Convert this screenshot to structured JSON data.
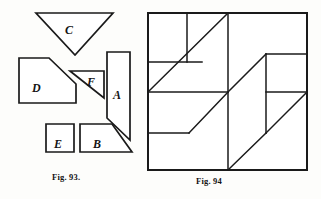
{
  "page": {
    "width": 321,
    "height": 199,
    "background_color": "#fdfdfb",
    "ink_color": "#1a1a1a"
  },
  "figures": [
    {
      "id": "fig-93",
      "caption": "Fig. 93.",
      "caption_x": 52,
      "caption_y": 172,
      "role": "dissection-pieces",
      "piece_count": 6,
      "pieces": [
        {
          "label": "C",
          "shape": "triangle",
          "orientation": "point-down",
          "label_x": 65,
          "label_y": 24,
          "points": "36,13 113,13 75,55"
        },
        {
          "label": "D",
          "shape": "pentagon",
          "label_x": 32,
          "label_y": 82,
          "points": "19,58 49,58 76,84 76,103 19,103"
        },
        {
          "label": "F",
          "shape": "triangle",
          "orientation": "point-down-right",
          "label_x": 87,
          "label_y": 76,
          "points": "70,71 104,71 104,98"
        },
        {
          "label": "A",
          "shape": "parallelogram",
          "label_x": 113,
          "label_y": 89,
          "points": "107,52 130,52 130,140 107,118"
        },
        {
          "label": "E",
          "shape": "square",
          "label_x": 54,
          "label_y": 138,
          "points": "46,124 74,124 74,152 46,152"
        },
        {
          "label": "B",
          "shape": "right-trapezoid",
          "label_x": 93,
          "label_y": 138,
          "points": "80,124 112,124 132,152 80,152"
        }
      ]
    },
    {
      "id": "fig-94",
      "caption": "Fig. 94",
      "caption_x": 196,
      "caption_y": 176,
      "role": "assembled-square",
      "square": {
        "x": 148,
        "y": 13,
        "width": 159,
        "height": 157
      },
      "cut_lines": [
        {
          "name": "horizontal-upper-left",
          "x1": 148,
          "y1": 62,
          "x2": 202,
          "y2": 62
        },
        {
          "name": "vertical-upper-left",
          "x1": 187,
          "y1": 13,
          "x2": 187,
          "y2": 62
        },
        {
          "name": "diagonal-upper-left",
          "x1": 148,
          "y1": 92,
          "x2": 228,
          "y2": 13
        },
        {
          "name": "vertical-center",
          "x1": 228,
          "y1": 13,
          "x2": 228,
          "y2": 170
        },
        {
          "name": "horizontal-mid-left",
          "x1": 148,
          "y1": 92,
          "x2": 228,
          "y2": 92
        },
        {
          "name": "diagonal-mid-left",
          "x1": 148,
          "y1": 133,
          "x2": 189,
          "y2": 133
        },
        {
          "name": "diagonal-lower-left",
          "x1": 189,
          "y1": 133,
          "x2": 228,
          "y2": 92
        },
        {
          "name": "diagonal-center-long",
          "x1": 228,
          "y1": 92,
          "x2": 266,
          "y2": 54
        },
        {
          "name": "horizontal-upper-right",
          "x1": 266,
          "y1": 54,
          "x2": 307,
          "y2": 54
        },
        {
          "name": "vertical-right-inner",
          "x1": 266,
          "y1": 54,
          "x2": 266,
          "y2": 133
        },
        {
          "name": "horizontal-mid-right",
          "x1": 266,
          "y1": 92,
          "x2": 307,
          "y2": 92
        },
        {
          "name": "diagonal-lower-right",
          "x1": 266,
          "y1": 133,
          "x2": 307,
          "y2": 92
        },
        {
          "name": "diagonal-bottom-center",
          "x1": 228,
          "y1": 170,
          "x2": 266,
          "y2": 133
        }
      ]
    }
  ]
}
